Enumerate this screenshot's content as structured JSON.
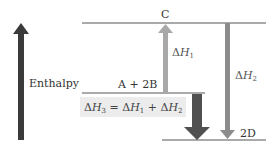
{
  "diagram": {
    "type": "enthalpy-level-diagram",
    "axis": {
      "label": "Enthalpy",
      "direction": "up"
    },
    "levels": [
      {
        "id": "C",
        "label": "C"
      },
      {
        "id": "A2B",
        "label": "A + 2B"
      },
      {
        "id": "2D",
        "label": "2D"
      }
    ],
    "arrows": [
      {
        "id": "dH1",
        "delta": "Δ",
        "symbol": "H",
        "sub": "1",
        "from": "A + 2B",
        "to": "C",
        "direction": "up"
      },
      {
        "id": "dH2",
        "delta": "Δ",
        "symbol": "H",
        "sub": "2",
        "from": "C",
        "to": "2D",
        "direction": "down"
      },
      {
        "id": "dH3",
        "from": "A + 2B",
        "to": "2D",
        "direction": "down"
      }
    ],
    "equation": {
      "lhs_delta": "Δ",
      "lhs_symbol": "H",
      "lhs_sub": "3",
      "eq": " = ",
      "t1_delta": "Δ",
      "t1_symbol": "H",
      "t1_sub": "1",
      "plus": " + ",
      "t2_delta": "Δ",
      "t2_symbol": "H",
      "t2_sub": "2"
    },
    "colors": {
      "axis_arrow": "#3a3a3a",
      "dH1_arrow": "#a8a8a8",
      "dH2_arrow": "#8c8c8c",
      "dH3_arrow": "#505050",
      "level_line": "#555555",
      "equation_bg": "#ececec"
    }
  }
}
